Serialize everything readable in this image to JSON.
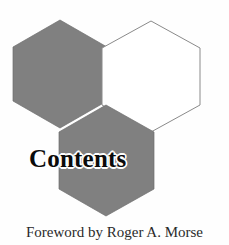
{
  "page": {
    "background_color": "#fefefe",
    "width": 229,
    "height": 245
  },
  "title": {
    "text": "Contents",
    "color": "#0b0b0b",
    "halo_color": "#ffffff"
  },
  "credit": {
    "text": "Foreword by Roger A. Morse",
    "color": "#2a2a2a"
  },
  "artwork": {
    "name": "three-hexagon-honeycomb",
    "fill_gray": "#808080",
    "fill_white": "#ffffff",
    "outline_color": "#888888",
    "hexagons": [
      {
        "name": "hexagon-upper-left",
        "fill": "#808080",
        "center_x": 60,
        "center_y": 74,
        "radius": 54
      },
      {
        "name": "hexagon-upper-right",
        "fill": "#ffffff",
        "center_x": 151,
        "center_y": 74,
        "radius": 54
      },
      {
        "name": "hexagon-lower-middle",
        "fill": "#808080",
        "center_x": 106,
        "center_y": 160,
        "radius": 55
      }
    ]
  }
}
